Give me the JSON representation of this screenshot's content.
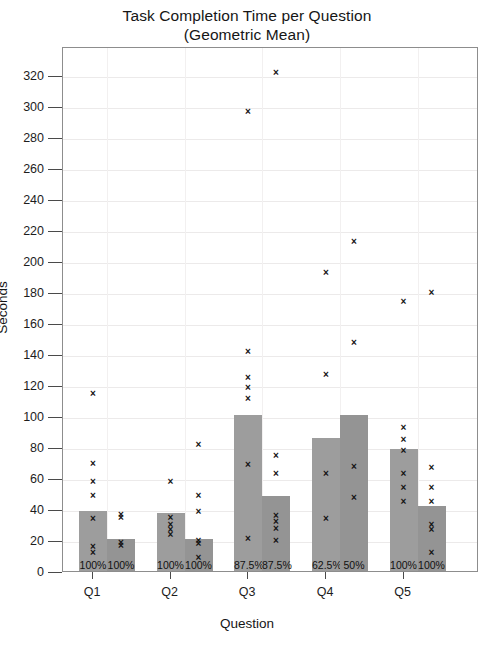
{
  "chart_data": {
    "type": "bar",
    "title": "Task Completion Time per Question",
    "subtitle": "(Geometric Mean)",
    "xlabel": "Question",
    "ylabel": "Seconds",
    "ylim": [
      0,
      330
    ],
    "ytick_step": 20,
    "yticks": [
      0,
      20,
      40,
      60,
      80,
      100,
      120,
      140,
      160,
      180,
      200,
      220,
      240,
      260,
      280,
      300,
      320
    ],
    "categories": [
      "Q1",
      "Q2",
      "Q3",
      "Q4",
      "Q5"
    ],
    "grid": true,
    "legend": "none",
    "bar_color": "#9d9d9d",
    "point_marker": "x",
    "series": [
      {
        "name": "Condition A",
        "values": [
          40,
          39,
          102,
          87,
          80
        ],
        "completion_labels": [
          "100%",
          "100%",
          "87.5%",
          "62.5%",
          "100%"
        ]
      },
      {
        "name": "Condition B",
        "values": [
          22,
          22,
          50,
          102,
          43
        ],
        "completion_labels": [
          "100%",
          "100%",
          "87.5%",
          "50%",
          "100%"
        ]
      }
    ],
    "scatter_points": [
      {
        "category": "Q1",
        "series": 0,
        "value": 116
      },
      {
        "category": "Q1",
        "series": 0,
        "value": 71
      },
      {
        "category": "Q1",
        "series": 0,
        "value": 59
      },
      {
        "category": "Q1",
        "series": 0,
        "value": 50
      },
      {
        "category": "Q1",
        "series": 0,
        "value": 35
      },
      {
        "category": "Q1",
        "series": 0,
        "value": 17
      },
      {
        "category": "Q1",
        "series": 0,
        "value": 13
      },
      {
        "category": "Q1",
        "series": 1,
        "value": 38
      },
      {
        "category": "Q1",
        "series": 1,
        "value": 36
      },
      {
        "category": "Q1",
        "series": 1,
        "value": 20
      },
      {
        "category": "Q1",
        "series": 1,
        "value": 18
      },
      {
        "category": "Q2",
        "series": 0,
        "value": 59
      },
      {
        "category": "Q2",
        "series": 0,
        "value": 36
      },
      {
        "category": "Q2",
        "series": 0,
        "value": 31
      },
      {
        "category": "Q2",
        "series": 0,
        "value": 28
      },
      {
        "category": "Q2",
        "series": 0,
        "value": 25
      },
      {
        "category": "Q2",
        "series": 1,
        "value": 83
      },
      {
        "category": "Q2",
        "series": 1,
        "value": 50
      },
      {
        "category": "Q2",
        "series": 1,
        "value": 40
      },
      {
        "category": "Q2",
        "series": 1,
        "value": 21
      },
      {
        "category": "Q2",
        "series": 1,
        "value": 19
      },
      {
        "category": "Q2",
        "series": 1,
        "value": 10
      },
      {
        "category": "Q3",
        "series": 0,
        "value": 298
      },
      {
        "category": "Q3",
        "series": 0,
        "value": 143
      },
      {
        "category": "Q3",
        "series": 0,
        "value": 126
      },
      {
        "category": "Q3",
        "series": 0,
        "value": 120
      },
      {
        "category": "Q3",
        "series": 0,
        "value": 113
      },
      {
        "category": "Q3",
        "series": 0,
        "value": 70
      },
      {
        "category": "Q3",
        "series": 0,
        "value": 22
      },
      {
        "category": "Q3",
        "series": 1,
        "value": 323
      },
      {
        "category": "Q3",
        "series": 1,
        "value": 76
      },
      {
        "category": "Q3",
        "series": 1,
        "value": 64
      },
      {
        "category": "Q3",
        "series": 1,
        "value": 37
      },
      {
        "category": "Q3",
        "series": 1,
        "value": 33
      },
      {
        "category": "Q3",
        "series": 1,
        "value": 29
      },
      {
        "category": "Q3",
        "series": 1,
        "value": 21
      },
      {
        "category": "Q4",
        "series": 0,
        "value": 194
      },
      {
        "category": "Q4",
        "series": 0,
        "value": 128
      },
      {
        "category": "Q4",
        "series": 0,
        "value": 64
      },
      {
        "category": "Q4",
        "series": 0,
        "value": 35
      },
      {
        "category": "Q4",
        "series": 1,
        "value": 214
      },
      {
        "category": "Q4",
        "series": 1,
        "value": 149
      },
      {
        "category": "Q4",
        "series": 1,
        "value": 69
      },
      {
        "category": "Q4",
        "series": 1,
        "value": 49
      },
      {
        "category": "Q5",
        "series": 0,
        "value": 175
      },
      {
        "category": "Q5",
        "series": 0,
        "value": 94
      },
      {
        "category": "Q5",
        "series": 0,
        "value": 86
      },
      {
        "category": "Q5",
        "series": 0,
        "value": 79
      },
      {
        "category": "Q5",
        "series": 0,
        "value": 64
      },
      {
        "category": "Q5",
        "series": 0,
        "value": 55
      },
      {
        "category": "Q5",
        "series": 0,
        "value": 46
      },
      {
        "category": "Q5",
        "series": 1,
        "value": 181
      },
      {
        "category": "Q5",
        "series": 1,
        "value": 68
      },
      {
        "category": "Q5",
        "series": 1,
        "value": 55
      },
      {
        "category": "Q5",
        "series": 1,
        "value": 46
      },
      {
        "category": "Q5",
        "series": 1,
        "value": 31
      },
      {
        "category": "Q5",
        "series": 1,
        "value": 28
      },
      {
        "category": "Q5",
        "series": 1,
        "value": 13
      }
    ]
  }
}
